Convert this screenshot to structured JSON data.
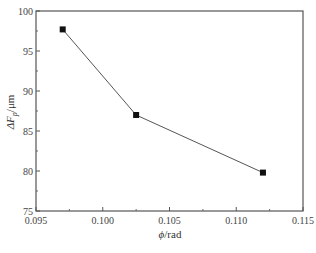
{
  "chart_data": {
    "type": "line",
    "title": "",
    "xlabel": "ϕ/rad",
    "ylabel": "ΔF_p/μm",
    "ylabel_main": "ΔF",
    "ylabel_sub": "p",
    "ylabel_unit": "/μm",
    "xlabel_symbol": "ϕ",
    "xlabel_unit": "/rad",
    "xlim": [
      0.095,
      0.115
    ],
    "ylim": [
      75,
      100
    ],
    "x_ticks": [
      "0.095",
      "0.100",
      "0.105",
      "0.110",
      "0.115"
    ],
    "y_ticks": [
      "75",
      "80",
      "85",
      "90",
      "95",
      "100"
    ],
    "grid": false,
    "legend": null,
    "series": [
      {
        "name": "ΔF_p",
        "marker": "square",
        "color": "#111111",
        "line_color": "#555555",
        "x": [
          0.097,
          0.1025,
          0.112
        ],
        "y": [
          97.7,
          87.0,
          79.8
        ]
      }
    ]
  }
}
